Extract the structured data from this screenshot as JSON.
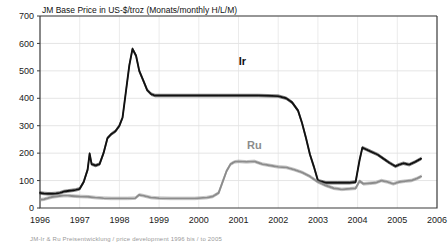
{
  "chart_data": {
    "type": "line",
    "title": "JM Base Price in US-$/troz (Monats/monthly  H/L/M)",
    "xlabel": "",
    "ylabel": "",
    "unit": "US-$/troz",
    "grid": true,
    "legend_position": "inline-annotation",
    "xlim": [
      1996,
      2006
    ],
    "ylim": [
      0,
      700
    ],
    "yticks": [
      0,
      100,
      200,
      300,
      400,
      500,
      600,
      700
    ],
    "xticks": [
      1996,
      1997,
      1998,
      1999,
      2000,
      2001,
      2002,
      2003,
      2004,
      2005,
      2006
    ],
    "xtick_labels": [
      "1996",
      "1997",
      "1998",
      "1999",
      "2000",
      "2001",
      "2002",
      "2003",
      "2004",
      "2005",
      "2006"
    ],
    "ytick_labels": [
      "0",
      "100",
      "200",
      "300",
      "400",
      "500",
      "600",
      "700"
    ],
    "annotations": [
      {
        "text": "Ir",
        "x": 2001.1,
        "y": 520,
        "color": "#111111"
      },
      {
        "text": "Ru",
        "x": 2001.4,
        "y": 215,
        "color": "#8c8c8c"
      }
    ],
    "series": [
      {
        "name": "Ir",
        "label": "Ir",
        "color": "#111111",
        "band": "H/L/M",
        "x": [
          1996.0,
          1996.1,
          1996.2,
          1996.3,
          1996.4,
          1996.5,
          1996.6,
          1996.7,
          1996.8,
          1996.9,
          1997.0,
          1997.1,
          1997.2,
          1997.25,
          1997.3,
          1997.4,
          1997.5,
          1997.6,
          1997.7,
          1997.8,
          1997.9,
          1998.0,
          1998.08,
          1998.16,
          1998.25,
          1998.33,
          1998.42,
          1998.5,
          1998.6,
          1998.7,
          1998.8,
          1998.9,
          1999.0,
          1999.5,
          2000.0,
          2000.5,
          2001.0,
          2001.5,
          2002.0,
          2002.2,
          2002.35,
          2002.5,
          2002.6,
          2002.7,
          2002.8,
          2002.9,
          2003.0,
          2003.2,
          2003.5,
          2003.8,
          2003.95,
          2004.05,
          2004.12,
          2004.2,
          2004.35,
          2004.5,
          2004.65,
          2004.8,
          2004.95,
          2005.05,
          2005.15,
          2005.3,
          2005.45,
          2005.6
        ],
        "values": [
          55,
          53,
          52,
          52,
          53,
          55,
          60,
          62,
          64,
          66,
          70,
          95,
          140,
          198,
          160,
          155,
          160,
          200,
          255,
          270,
          280,
          300,
          330,
          420,
          520,
          580,
          555,
          500,
          465,
          430,
          415,
          410,
          410,
          410,
          410,
          410,
          410,
          410,
          408,
          400,
          385,
          355,
          310,
          255,
          195,
          150,
          100,
          92,
          92,
          92,
          95,
          175,
          220,
          215,
          205,
          195,
          180,
          165,
          152,
          158,
          163,
          158,
          168,
          180
        ]
      },
      {
        "name": "Ru",
        "label": "Ru",
        "color": "#8c8c8c",
        "band": "H/L/M",
        "x": [
          1996.0,
          1996.1,
          1996.2,
          1996.3,
          1996.4,
          1996.5,
          1996.6,
          1996.7,
          1996.8,
          1996.9,
          1997.0,
          1997.2,
          1997.4,
          1997.6,
          1997.8,
          1998.0,
          1998.2,
          1998.4,
          1998.5,
          1998.6,
          1998.8,
          1999.0,
          1999.3,
          1999.6,
          1999.9,
          2000.0,
          2000.2,
          2000.35,
          2000.5,
          2000.6,
          2000.7,
          2000.8,
          2000.9,
          2001.0,
          2001.2,
          2001.4,
          2001.5,
          2001.6,
          2001.8,
          2002.0,
          2002.2,
          2002.4,
          2002.6,
          2002.8,
          2003.0,
          2003.2,
          2003.4,
          2003.6,
          2003.8,
          2003.95,
          2004.05,
          2004.15,
          2004.3,
          2004.45,
          2004.6,
          2004.75,
          2004.9,
          2005.05,
          2005.2,
          2005.35,
          2005.5,
          2005.6
        ],
        "values": [
          30,
          32,
          36,
          40,
          42,
          44,
          45,
          45,
          44,
          43,
          42,
          41,
          38,
          36,
          35,
          35,
          35,
          36,
          48,
          45,
          38,
          36,
          35,
          35,
          35,
          36,
          38,
          42,
          55,
          95,
          135,
          160,
          168,
          170,
          168,
          170,
          165,
          160,
          155,
          150,
          148,
          140,
          130,
          115,
          95,
          82,
          72,
          68,
          70,
          72,
          98,
          88,
          90,
          92,
          100,
          95,
          88,
          95,
          98,
          100,
          108,
          115
        ]
      }
    ]
  },
  "caption": "JM-Ir & Ru Preisentwicklung / price development 1996 bis / to 2005"
}
